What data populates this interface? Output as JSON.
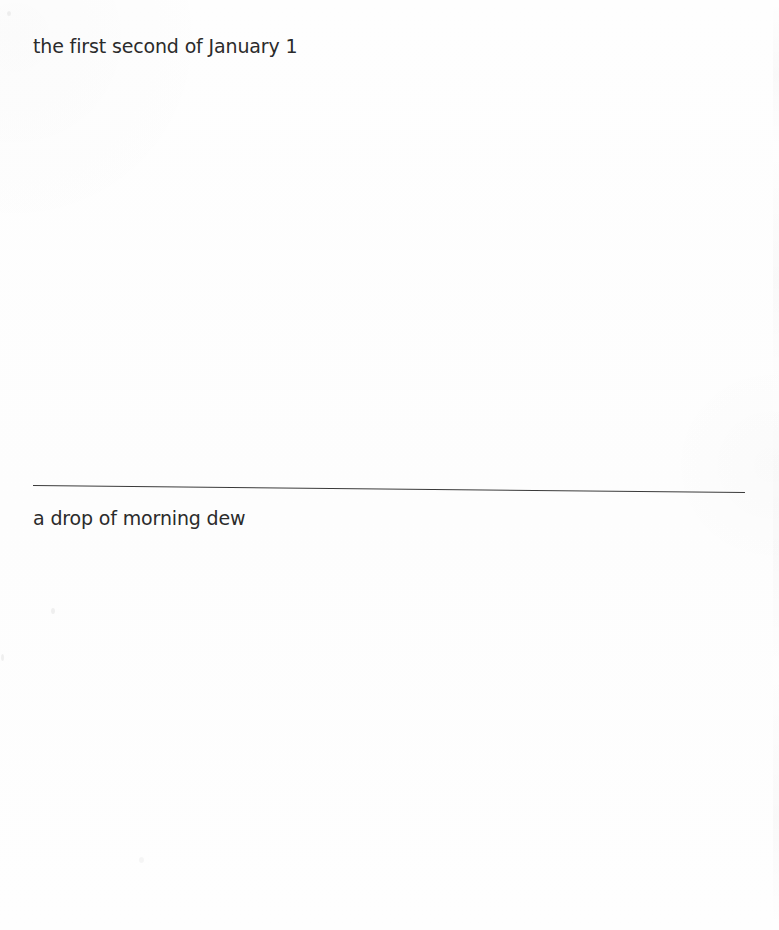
{
  "document": {
    "type": "scanned-poetry-page",
    "background_color": "#fefefe",
    "text_color": "#2b2b2b",
    "rule_color": "#3a3a3a",
    "lines": [
      {
        "id": "upper",
        "text": "the first second of January 1"
      },
      {
        "id": "lower",
        "text": "a drop of morning dew"
      }
    ],
    "divider": {
      "name": "horizontal-rule",
      "left_x": 33,
      "right_x": 745,
      "top_y": 485,
      "tilt_degrees": 0.56
    }
  }
}
